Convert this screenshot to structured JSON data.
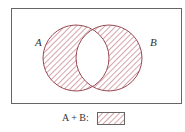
{
  "diagram": {
    "type": "venn",
    "universe": {
      "x": 11,
      "y": 8,
      "width": 170,
      "height": 95
    },
    "sets": [
      {
        "label": "A",
        "cx": 76,
        "cy": 58,
        "r": 33,
        "label_x": 36,
        "label_y": 38
      },
      {
        "label": "B",
        "cx": 109,
        "cy": 58,
        "r": 33,
        "label_x": 150,
        "label_y": 38
      }
    ],
    "shaded_region": "symmetric difference (A and B excluding intersection)",
    "colors": {
      "border": "#666666",
      "circle_stroke": "#9a4a52",
      "hatch": "#b05a64"
    }
  },
  "legend": {
    "text": "A + B:",
    "swatch": "hatched"
  }
}
